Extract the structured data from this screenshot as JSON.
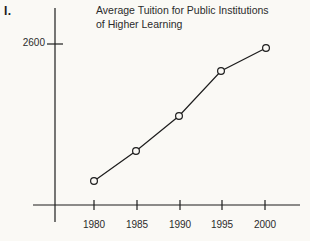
{
  "problem": {
    "number_label": "I."
  },
  "chart_data": {
    "type": "line",
    "title": "Average Tuition for Public Institutions of Higher Learning",
    "title_lines": [
      "Average Tuition for Public Institutions",
      "of Higher Learning"
    ],
    "xlabel": "",
    "ylabel": "",
    "x": [
      1980,
      1985,
      1990,
      1995,
      2000
    ],
    "categories": [
      "1980",
      "1985",
      "1990",
      "1995",
      "2000"
    ],
    "values": [
      1000,
      1300,
      1700,
      2200,
      2450
    ],
    "series": [
      {
        "name": "Average Tuition",
        "values": [
          1000,
          1300,
          1700,
          2200,
          2450
        ]
      }
    ],
    "xtick_labels": [
      "1980",
      "1985",
      "1990",
      "1995",
      "2000"
    ],
    "ytick_labels": [
      "2600"
    ],
    "ytick_values": [
      2600
    ],
    "ylim": [
      0,
      2850
    ],
    "xlim": [
      1978,
      2002
    ],
    "grid": false,
    "legend": false,
    "marker": "open-circle",
    "line_color": "#1d1d1d",
    "marker_fill": "#faf9f5",
    "background_color": "#faf9f5",
    "axis_color": "#1d1d1d"
  },
  "geometry": {
    "y_axis_x": 55,
    "x_axis_y": 205,
    "y_axis_top": 8,
    "y_axis_bottom": 222,
    "x_axis_left": 33,
    "x_axis_right": 300,
    "tick_x_positions": [
      94,
      137,
      180,
      222,
      265
    ],
    "ytick_2600_y": 44,
    "point_pixels": [
      {
        "x": 94,
        "y": 181
      },
      {
        "x": 136,
        "y": 151
      },
      {
        "x": 179,
        "y": 116
      },
      {
        "x": 221,
        "y": 71
      },
      {
        "x": 266,
        "y": 48
      }
    ]
  }
}
